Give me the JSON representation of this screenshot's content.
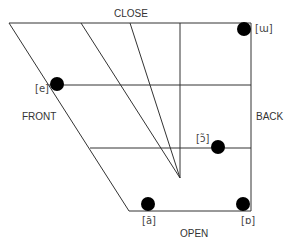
{
  "diagram": {
    "type": "vowel-quadrilateral",
    "axis_labels": {
      "top": "CLOSE",
      "bottom": "OPEN",
      "left": "FRONT",
      "right": "BACK"
    },
    "vowels": [
      {
        "symbol": "[ɯ]",
        "position": "close back"
      },
      {
        "symbol": "[e]",
        "position": "close-mid front"
      },
      {
        "symbol": "[ɔ̃]",
        "position": "open-mid back"
      },
      {
        "symbol": "[ã]",
        "position": "open front"
      },
      {
        "symbol": "[ɒ]",
        "position": "open back"
      }
    ],
    "colors": {
      "line": "#333333",
      "dot": "#000000",
      "background": "#ffffff"
    }
  }
}
